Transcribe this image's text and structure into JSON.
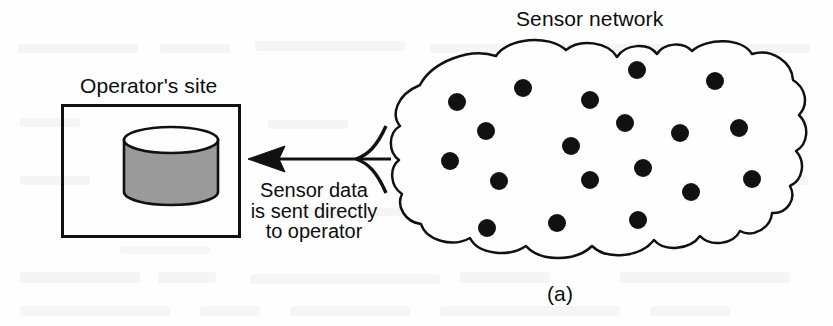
{
  "figure": {
    "caption": "(a)",
    "operator_site_label": "Operator's site",
    "sensor_network_label": "Sensor network",
    "annotation_lines": [
      "Sensor data",
      "is sent directly",
      "to operator"
    ],
    "colors": {
      "ink": "#111111",
      "background": "#fefefe",
      "cylinder_body": "#9a9a9a",
      "cylinder_top": "#fdfdfd",
      "dot": "#111111"
    },
    "operator_box": {
      "x": 61,
      "y": 104,
      "width": 180,
      "height": 134
    },
    "database_cylinder": {
      "center_x": 171,
      "top_y": 140,
      "bottom_y": 204,
      "radius_x": 47,
      "radius_y": 13
    },
    "arrow": {
      "tip_x": 248,
      "tip_y": 159,
      "junction_x": 356,
      "junction_y": 159,
      "branches": 3,
      "direction": "left",
      "meaning": "sensor data flows from sensor network directly to operator site"
    },
    "cloud": {
      "label": "sensor-network-cloud",
      "left": 392,
      "top": 47,
      "right": 801,
      "bottom": 258
    },
    "sensor_count": 19,
    "sensor_dot_radius": 9,
    "sensor_dots": [
      {
        "x": 457,
        "y": 102
      },
      {
        "x": 523,
        "y": 88
      },
      {
        "x": 486,
        "y": 131
      },
      {
        "x": 450,
        "y": 161
      },
      {
        "x": 499,
        "y": 181
      },
      {
        "x": 487,
        "y": 228
      },
      {
        "x": 590,
        "y": 100
      },
      {
        "x": 571,
        "y": 146
      },
      {
        "x": 590,
        "y": 180
      },
      {
        "x": 557,
        "y": 223
      },
      {
        "x": 637,
        "y": 70
      },
      {
        "x": 625,
        "y": 123
      },
      {
        "x": 643,
        "y": 168
      },
      {
        "x": 638,
        "y": 220
      },
      {
        "x": 680,
        "y": 133
      },
      {
        "x": 691,
        "y": 192
      },
      {
        "x": 715,
        "y": 81
      },
      {
        "x": 739,
        "y": 128
      },
      {
        "x": 752,
        "y": 179
      }
    ]
  }
}
